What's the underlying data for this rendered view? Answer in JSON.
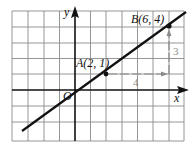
{
  "diagram": {
    "type": "coordinate-plane-line",
    "grid": {
      "columns": 11,
      "rows": 8,
      "x_range": [
        -4,
        7
      ],
      "y_range": [
        -3,
        5
      ]
    },
    "axes": {
      "x_label": "x",
      "y_label": "y",
      "origin_label": "O"
    },
    "points": [
      {
        "name": "A",
        "label": "A(2, 1)",
        "x": 2,
        "y": 1
      },
      {
        "name": "B",
        "label": "B(6, 4)",
        "x": 6,
        "y": 4
      }
    ],
    "line": {
      "slope": "3/4",
      "through": [
        "A",
        "B"
      ]
    },
    "run": {
      "label": "4",
      "color": "#8c8c8c"
    },
    "rise": {
      "label": "3",
      "color": "#8c8c8c"
    }
  }
}
